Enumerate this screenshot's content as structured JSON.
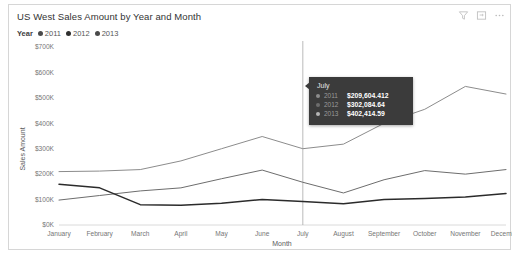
{
  "visual": {
    "title": "US West Sales Amount by Year and Month"
  },
  "actions": [
    {
      "name": "filter-icon",
      "label": "Filters"
    },
    {
      "name": "focus-mode-icon",
      "label": "Focus mode"
    },
    {
      "name": "more-options-icon",
      "label": "More options"
    }
  ],
  "legend": {
    "title": "Year",
    "items": [
      {
        "label": "2011",
        "color": "#4a4a4a"
      },
      {
        "label": "2012",
        "color": "#8c8c8c"
      },
      {
        "label": "2013",
        "color": "#2b2b2b"
      }
    ]
  },
  "tooltip": {
    "header": "July",
    "rows": [
      {
        "year": "2011",
        "value": "$209,604.412",
        "color": "#8c8c8c"
      },
      {
        "year": "2012",
        "value": "$302,084.64",
        "color": "#6d6d6d"
      },
      {
        "year": "2013",
        "value": "$402,414.59",
        "color": "#b5b5b5"
      }
    ]
  },
  "chart_data": {
    "type": "line",
    "title": "US West Sales Amount by Year and Month",
    "xlabel": "Month",
    "ylabel": "Sales Amount",
    "categories": [
      "January",
      "February",
      "March",
      "April",
      "May",
      "June",
      "July",
      "August",
      "September",
      "October",
      "November",
      "December"
    ],
    "ytick_labels": [
      "$0K",
      "$100K",
      "$200K",
      "$300K",
      "$400K",
      "$500K",
      "$600K",
      "$700K"
    ],
    "ytick_values": [
      0,
      100000,
      200000,
      300000,
      400000,
      500000,
      600000,
      700000
    ],
    "ylim": [
      0,
      700000
    ],
    "grid": false,
    "legend_position": "top-left",
    "series": [
      {
        "name": "2011",
        "color": "#8c8c8c",
        "values": [
          210000,
          212000,
          218000,
          252000,
          300000,
          348000,
          300000,
          318000,
          400000,
          455000,
          545000,
          515000
        ]
      },
      {
        "name": "2012",
        "color": "#6d6d6d",
        "values": [
          98000,
          116000,
          134000,
          146000,
          182000,
          216000,
          168000,
          126000,
          178000,
          214000,
          200000,
          218000
        ]
      },
      {
        "name": "2013",
        "color": "#2b2b2b",
        "values": [
          160000,
          146000,
          80000,
          78000,
          86000,
          100000,
          92000,
          84000,
          100000,
          104000,
          110000,
          124000
        ]
      }
    ],
    "annotations": [
      {
        "type": "hover-rule",
        "category": "July"
      }
    ]
  }
}
